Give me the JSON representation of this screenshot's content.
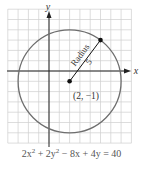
{
  "figure": {
    "axis_labels": {
      "x": "x",
      "y": "y"
    },
    "center": {
      "x": 2,
      "y": -1,
      "label": "(2, −1)"
    },
    "radius": {
      "value": 5,
      "label_word": "Radius",
      "label_value": "5"
    },
    "point_on_circle": {
      "x": 5,
      "y": 3
    },
    "grid": {
      "x_min": -4,
      "x_max": 8,
      "y_min": -7,
      "y_max": 6
    },
    "colors": {
      "grid": "#c8c8c8",
      "circle": "#6e6e6e",
      "axis": "#222222",
      "point": "#111111",
      "text": "#333333"
    }
  },
  "caption": {
    "a": "2x",
    "b": "2",
    "c": " + 2y",
    "d": "2",
    "e": " − 8x + 4y = 40"
  }
}
